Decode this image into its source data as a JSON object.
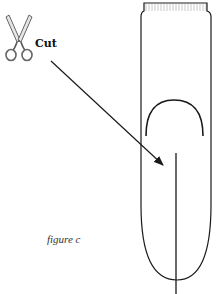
{
  "figure": {
    "caption": "figure c",
    "cut_label": "Cut",
    "icons": {
      "scissors": "scissors-icon"
    },
    "colors": {
      "stroke": "#1a1a1a",
      "scissors_fill": "#e6e6e6",
      "scissors_stroke": "#555555",
      "comb": "#bbbbbb"
    }
  }
}
